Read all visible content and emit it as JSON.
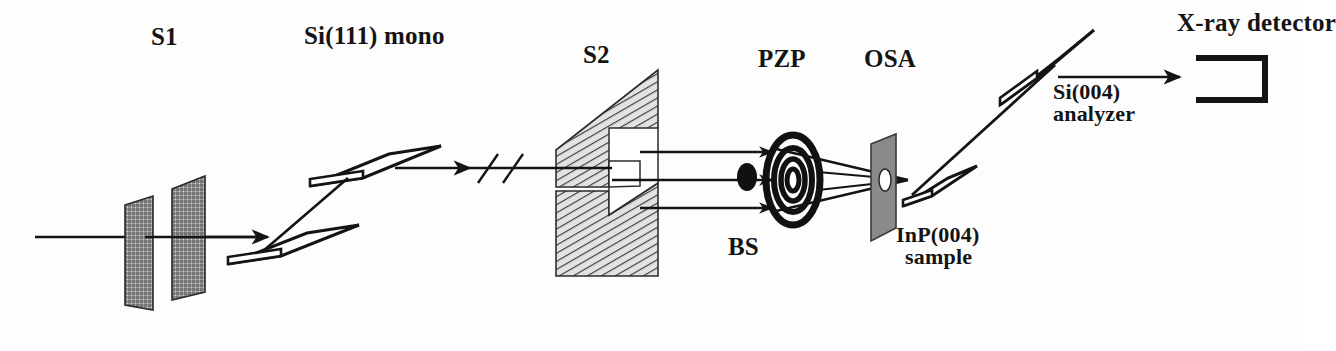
{
  "figure": {
    "domain": "Diagram",
    "kind": "x-ray-beamline-schematic",
    "background_color": "#fdfdfd",
    "ink_color": "#141414",
    "hatch_color": "#555555",
    "osa_fill_color": "#8a8a8a"
  },
  "labels": {
    "s1": "S1",
    "mono": "Si(111) mono",
    "s2": "S2",
    "pzp": "PZP",
    "osa": "OSA",
    "bs": "BS",
    "detector": "X-ray detector",
    "analyzer_line1": "Si(004)",
    "analyzer_line2": "analyzer",
    "sample_line1": "InP(004)",
    "sample_line2": "sample"
  },
  "components": [
    {
      "id": "s1",
      "name": "S1",
      "full_name": "Slit 1",
      "type": "slit-pair",
      "rendering": "two cross-hatched parallelogram plates",
      "label_position": "above",
      "order": 1
    },
    {
      "id": "mono",
      "name": "Si(111) mono",
      "full_name": "Silicon (111) double-crystal monochromator",
      "type": "double-crystal-monochromator",
      "rendering": "two stacked flat parallelogram crystals",
      "label_position": "above",
      "order": 2
    },
    {
      "id": "break",
      "name": "distance break",
      "full_name": "beam path length break symbol",
      "type": "break-mark",
      "rendering": "double diagonal slash across beam axis",
      "label_position": "none",
      "order": 3
    },
    {
      "id": "s2",
      "name": "S2",
      "full_name": "Slit 2",
      "type": "slit-pair",
      "rendering": "two diagonally hatched parallelogram blades with rectangular aperture",
      "label_position": "above",
      "order": 4
    },
    {
      "id": "bs",
      "name": "BS",
      "full_name": "Beamstop",
      "type": "beamstop",
      "rendering": "filled black ellipse on central ray",
      "label_position": "below",
      "order": 5
    },
    {
      "id": "pzp",
      "name": "PZP",
      "full_name": "Phase zone plate",
      "type": "zone-plate",
      "rendering": "four concentric black elliptical rings",
      "label_position": "above",
      "order": 6
    },
    {
      "id": "osa",
      "name": "OSA",
      "full_name": "Order sorting aperture",
      "type": "aperture",
      "rendering": "gray parallelogram plate with small central hole",
      "label_position": "above",
      "order": 7
    },
    {
      "id": "sample",
      "name": "InP(004) sample",
      "full_name": "Indium phosphide (004) sample crystal",
      "type": "sample-crystal",
      "rendering": "flat tilted parallelogram crystal",
      "label_position": "below",
      "order": 8
    },
    {
      "id": "analyzer",
      "name": "Si(004) analyzer",
      "full_name": "Silicon (004) analyzer crystal",
      "type": "analyzer-crystal",
      "rendering": "flat tilted parallelogram crystal",
      "label_position": "below-right",
      "order": 9
    },
    {
      "id": "detector",
      "name": "X-ray detector",
      "full_name": "X-ray detector",
      "type": "detector",
      "rendering": "open C-shaped rectangle outline",
      "label_position": "above",
      "order": 10
    }
  ],
  "beam_path": {
    "description": "White beam enters from left, is monochromated by Si(111), apertured by S1 and S2, focused by the phase zone plate with central beamstop, order-sorted by the OSA, diffracted by the InP(004) sample, analyzed by the Si(004) crystal and recorded by the X-ray detector.",
    "segments": [
      "source to S1",
      "S1 to Si(111) mono lower crystal",
      "mono lower to mono upper crystal",
      "mono upper crystal to break",
      "break to S2",
      "S2 to PZP (three parallel rays, central ray blocked by BS)",
      "PZP to OSA (converging rays)",
      "OSA to InP(004) sample",
      "sample to Si(004) analyzer",
      "analyzer to X-ray detector"
    ],
    "ray_count_s2_to_pzp": 3,
    "zone_plate_rings": 4
  }
}
